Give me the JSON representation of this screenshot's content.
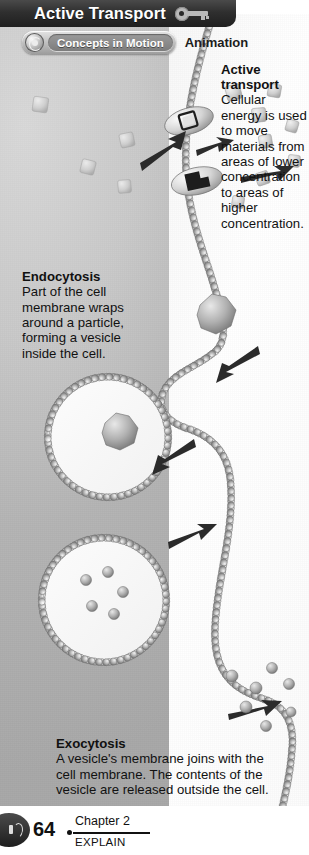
{
  "header": {
    "title": "Active Transport",
    "key_icon": "key-icon"
  },
  "media_bar": {
    "globe_icon": "concepts-in-motion-globe-icon",
    "pill_label": "Concepts in Motion",
    "media_type": "Animation"
  },
  "callouts": {
    "active_transport": {
      "heading_line1": "Active",
      "heading_line2": "transport",
      "body": "Cellular energy is used to move materials from areas of lower concentration to areas of higher concentration."
    },
    "endocytosis": {
      "heading": "Endocytosis",
      "body": "Part of the cell membrane wraps around a particle, forming a vesicle inside the cell."
    },
    "exocytosis": {
      "heading": "Exocytosis",
      "body": "A vesicle's membrane joins with the cell membrane. The contents of the vesicle are released outside the cell."
    },
    "outside_label_line1": "Outside",
    "outside_label_line2": "the cell",
    "inside_label_line1": "Inside",
    "inside_label_line2": "the cell"
  },
  "figure": {
    "membrane_label": "phospholipid-bilayer",
    "protein_label": "transport-protein",
    "vesicle_label": "vesicle",
    "particle_label": "particle",
    "arrow_label": "direction-arrow"
  },
  "footer": {
    "audio_icon": "audio-speaker-icon",
    "page_number": "64",
    "chapter": "Chapter 2",
    "section": "EXPLAIN"
  },
  "colors": {
    "title_bar": "#2f2f2f",
    "title_text": "#ffffff",
    "body_text": "#111111",
    "cytoplasm": "#b4b4b4",
    "extracellular": "#ffffff",
    "membrane": "#9a9a9a"
  }
}
